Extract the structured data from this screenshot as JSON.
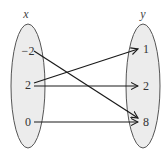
{
  "diagram": {
    "domain_set": {
      "label": "x",
      "elements": [
        "−2",
        "2",
        "0"
      ]
    },
    "range_set": {
      "label": "y",
      "elements": [
        "1",
        "2",
        "8"
      ]
    },
    "mappings": [
      {
        "from": "−2",
        "to": "8"
      },
      {
        "from": "2",
        "to": "1"
      },
      {
        "from": "2",
        "to": "2"
      },
      {
        "from": "0",
        "to": "8"
      }
    ],
    "colors": {
      "ellipse_fill": "#ececec",
      "ellipse_stroke": "#555555",
      "arrow": "#1a1a1a"
    }
  }
}
